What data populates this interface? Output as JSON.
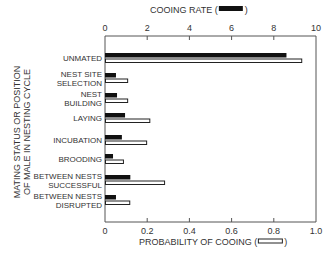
{
  "chart_data": {
    "type": "bar",
    "orientation": "horizontal",
    "title": "",
    "ylabel": "MATING STATUS OR POSITION OF MALE IN NESTING CYCLE",
    "ylabel_lines": [
      "MATING STATUS OR POSITION",
      "OF MALE IN NESTING CYCLE"
    ],
    "top_axis": {
      "label": "COOING RATE",
      "legend_swatch": "filled-black",
      "ticks": [
        0,
        2,
        4,
        6,
        8,
        10
      ],
      "range": [
        0,
        10
      ]
    },
    "bottom_axis": {
      "label": "PROBABILITY OF COOING",
      "legend_swatch": "open-white",
      "ticks": [
        "0",
        "0.2",
        "0.4",
        "0.6",
        "0.8",
        "1.0"
      ],
      "range": [
        0,
        1.0
      ]
    },
    "categories": [
      [
        "UNMATED"
      ],
      [
        "NEST SITE",
        "SELECTION"
      ],
      [
        "NEST",
        "BUILDING"
      ],
      [
        "LAYING"
      ],
      [
        "INCUBATION"
      ],
      [
        "BROODING"
      ],
      [
        "BETWEEN NESTS",
        "SUCCESSFUL"
      ],
      [
        "BETWEEN NESTS",
        "DISRUPTED"
      ]
    ],
    "series": [
      {
        "name": "Cooing rate",
        "axis": "top",
        "style": "filled-black",
        "values": [
          8.6,
          0.52,
          0.57,
          0.95,
          0.8,
          0.38,
          1.2,
          0.52
        ]
      },
      {
        "name": "Probability of cooing",
        "axis": "bottom",
        "style": "open-white",
        "values": [
          0.93,
          0.105,
          0.105,
          0.21,
          0.195,
          0.085,
          0.28,
          0.115
        ]
      }
    ],
    "grid": false,
    "legend_position": "inline in axis titles"
  },
  "labels": {
    "top_axis_title": "COOING RATE (",
    "top_axis_title_close": ")",
    "bottom_axis_title": "PROBABILITY OF COOING (",
    "bottom_axis_title_close": ")"
  }
}
